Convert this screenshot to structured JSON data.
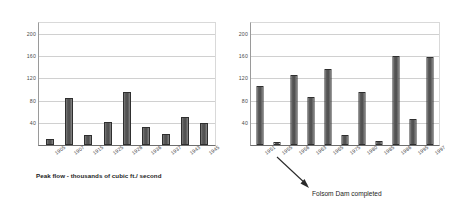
{
  "figure": {
    "title": "",
    "caption_left": "Peak flow - thousands of cubic ft./ second"
  },
  "annotations": [
    {
      "name": "folsom-dam-completed",
      "text": "Folsom Dam completed",
      "points_to_year": "1955",
      "arrow": "down-right"
    }
  ],
  "chart_data": [
    {
      "id": "left",
      "type": "bar",
      "title": "",
      "subtitle": "",
      "xlabel": "",
      "ylabel": "Peak flow - thousands of cubic ft./ second",
      "ylim": [
        0,
        220
      ],
      "yticks": [
        40,
        80,
        120,
        160,
        200
      ],
      "ytick_labels": [
        "40",
        "80",
        "120",
        "160",
        "200"
      ],
      "grid": true,
      "legend": "none",
      "orientation": "vertical",
      "bar_color": "#4e4e4e",
      "categories": [
        "1905",
        "1907",
        "1915",
        "1925",
        "1928",
        "1936",
        "1937",
        "1943",
        "1945"
      ],
      "values": [
        10,
        85,
        18,
        41,
        95,
        33,
        20,
        51,
        39
      ]
    },
    {
      "id": "right",
      "type": "bar",
      "title": "",
      "subtitle": "",
      "xlabel": "",
      "ylabel": "",
      "ylim": [
        0,
        220
      ],
      "yticks": [
        40,
        80,
        120,
        160,
        200
      ],
      "ytick_labels": [
        "40",
        "80",
        "120",
        "160",
        "200"
      ],
      "grid": true,
      "legend": "none",
      "orientation": "vertical",
      "bar_color": "#4e4e4e",
      "categories": [
        "1951",
        "1955",
        "1956",
        "1963",
        "1965",
        "1975",
        "1980",
        "1985",
        "1986",
        "1995",
        "1997"
      ],
      "values": [
        107,
        6,
        126,
        87,
        137,
        18,
        95,
        8,
        160,
        47,
        158
      ]
    }
  ]
}
